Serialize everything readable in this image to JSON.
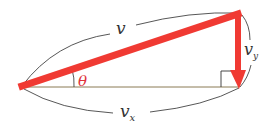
{
  "diagram": {
    "type": "vector-decomposition",
    "labels": {
      "v": "v",
      "vx": "v",
      "vx_sub": "x",
      "vy": "v",
      "vy_sub": "y",
      "theta": "θ"
    },
    "colors": {
      "vector": "#f03a33",
      "theta": "#e0323a",
      "baseline": "#8a7a55",
      "curves": "#444444",
      "text": "#333333"
    }
  }
}
